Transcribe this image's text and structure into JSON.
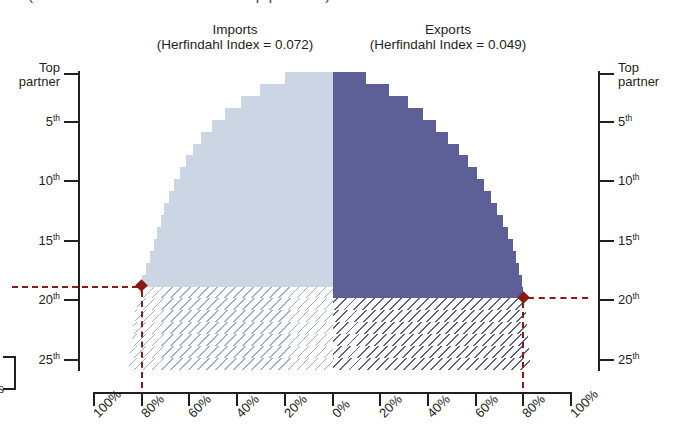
{
  "figure": {
    "cropped_title_fragment": "(cumulative share of trade with top partners)"
  },
  "panels": {
    "imports": {
      "title": "Imports",
      "subtitle": "(Herfindahl Index = 0.072)",
      "fill_color": "#ccd5e3",
      "marker_rank_label": "18th",
      "marker_share_label": "80%"
    },
    "exports": {
      "title": "Exports",
      "subtitle": "(Herfindahl Index = 0.049)",
      "fill_color": "#5d6096",
      "marker_rank_label": "19th",
      "marker_share_label": "80%"
    }
  },
  "axes": {
    "y_left": {
      "ticks": [
        {
          "label": "Top partner",
          "rank": 1,
          "two_line": true
        },
        {
          "label": "5",
          "rank": 5,
          "suffix": "th"
        },
        {
          "label": "10",
          "rank": 10,
          "suffix": "th"
        },
        {
          "label": "15",
          "rank": 15,
          "suffix": "th"
        },
        {
          "label": "20",
          "rank": 20,
          "suffix": "th"
        },
        {
          "label": "25",
          "rank": 25,
          "suffix": "th"
        }
      ]
    },
    "y_right": {
      "ticks": [
        {
          "label": "Top partner",
          "rank": 1,
          "two_line": true
        },
        {
          "label": "5",
          "rank": 5,
          "suffix": "th"
        },
        {
          "label": "10",
          "rank": 10,
          "suffix": "th"
        },
        {
          "label": "15",
          "rank": 15,
          "suffix": "th"
        },
        {
          "label": "20",
          "rank": 20,
          "suffix": "th"
        },
        {
          "label": "25",
          "rank": 25,
          "suffix": "th"
        }
      ]
    },
    "x": {
      "labels": [
        "100%",
        "80%",
        "60%",
        "40%",
        "20%",
        "0%",
        "20%",
        "40%",
        "60%",
        "80%",
        "100%"
      ]
    }
  },
  "marker_color": "#8b1a16",
  "edge_fragment": {
    "label": "s"
  },
  "chart_data": {
    "type": "area",
    "xlabel": "Cumulative share of trade (%)",
    "ylabel": "Partner rank",
    "grid": false,
    "legend": "none",
    "ylim": [
      1,
      25
    ],
    "xlim": [
      0,
      100
    ],
    "y_is_rank_descending": true,
    "note": "Mirrored horizontal area chart: Imports extend leftward from 0% centre, Exports extend rightward. Values are cumulative share of total trade accounted for by the top-N partners.",
    "series": [
      {
        "name": "Imports",
        "side": "left",
        "herfindahl_index": 0.072,
        "color": "#ccd5e3",
        "hatched_below_rank": 18,
        "marker": {
          "rank": 18,
          "cumulative_share": 80
        },
        "ranks": [
          1,
          2,
          3,
          4,
          5,
          6,
          7,
          8,
          9,
          10,
          11,
          12,
          13,
          14,
          15,
          16,
          17,
          18,
          19,
          20,
          21,
          22,
          23,
          24,
          25
        ],
        "cumulative_share": [
          20.0,
          30.5,
          38.5,
          45.0,
          50.5,
          55.0,
          58.5,
          61.5,
          64.0,
          66.5,
          68.5,
          70.5,
          72.0,
          73.5,
          75.0,
          76.5,
          78.0,
          80.0,
          81.0,
          82.0,
          82.8,
          83.6,
          84.2,
          84.8,
          85.4
        ]
      },
      {
        "name": "Exports",
        "side": "right",
        "herfindahl_index": 0.049,
        "color": "#5d6096",
        "hatched_below_rank": 19,
        "marker": {
          "rank": 19,
          "cumulative_share": 80
        },
        "ranks": [
          1,
          2,
          3,
          4,
          5,
          6,
          7,
          8,
          9,
          10,
          11,
          12,
          13,
          14,
          15,
          16,
          17,
          18,
          19,
          20,
          21,
          22,
          23,
          24,
          25
        ],
        "cumulative_share": [
          14.0,
          23.5,
          31.5,
          38.0,
          43.5,
          48.5,
          53.0,
          57.0,
          60.5,
          63.5,
          66.5,
          69.0,
          71.5,
          73.5,
          75.5,
          77.0,
          78.3,
          79.3,
          80.0,
          80.6,
          81.2,
          81.7,
          82.1,
          82.5,
          82.9
        ]
      }
    ]
  }
}
